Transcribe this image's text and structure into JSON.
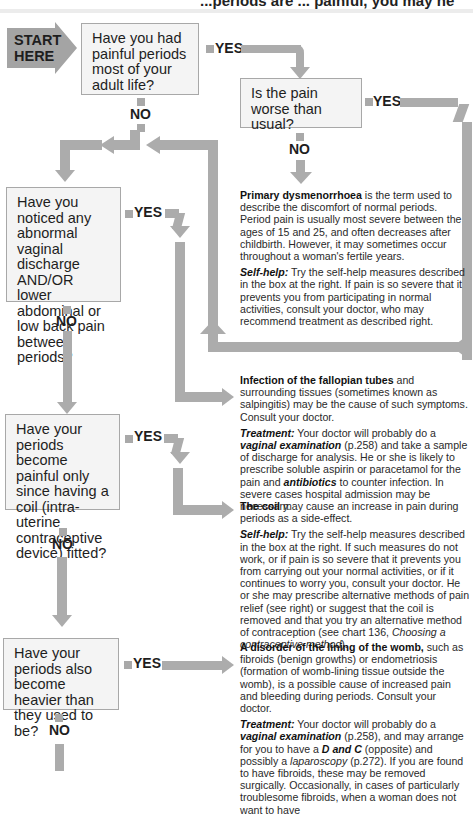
{
  "header": {
    "partial_text": "...periods are ... painful, you may ne"
  },
  "start": {
    "line1": "START",
    "line2": "HERE"
  },
  "labels": {
    "yes": "YES",
    "no": "NO"
  },
  "questions": [
    {
      "id": "q1",
      "text": "Have you had painful periods most of your adult life?"
    },
    {
      "id": "q2",
      "text": "Is the pain worse than usual?"
    },
    {
      "id": "q3",
      "text": "Have you noticed any abnormal vaginal discharge AND/OR lower abdominal or low back pain between periods?"
    },
    {
      "id": "q4",
      "text": "Have your periods become painful only since having a coil (intra-uterine contraceptive device) fitted?"
    },
    {
      "id": "q5",
      "text": "Have your periods also become heavier than they used to be?"
    }
  ],
  "outcomes": {
    "dysmenorrhoea": {
      "title": "Primary dysmenorrhoea",
      "body": " is the term used to describe the discomfort of normal periods. Period pain is usually most severe between the ages of 15 and 25, and often decreases after childbirth. However, it may sometimes occur throughout a woman's fertile years.",
      "selfhelp_label": "Self-help:",
      "selfhelp": " Try the self-help measures described in the box at the right. If pain is so severe that it prevents you from participating in normal activities, consult your doctor, who may recommend treatment as described right."
    },
    "infection": {
      "title": "Infection of the fallopian tubes",
      "body": " and surrounding tissues (sometimes known as salpingitis) may be the cause of such symptoms. Consult your doctor.",
      "treatment_label": "Treatment:",
      "t1": " Your doctor will probably do a ",
      "t_em1": "vaginal examination",
      "t2": " (p.258) and take a sample of discharge for analysis. He or she is likely to prescribe soluble aspirin or paracetamol for the pain and ",
      "t_em2": "antibiotics",
      "t3": " to counter infection. In severe cases hospital admission may be necessary."
    },
    "coil": {
      "title": "The coil",
      "body": " may cause an increase in pain during periods as a side-effect.",
      "selfhelp_label": "Self-help:",
      "s1": " Try the self-help measures described in the box at the right. If such measures do not work, or if pain is so severe that it prevents you from carrying out your normal activities, or if it continues to worry you, consult your doctor. He or she may prescribe alternative methods of pain relief (see right) or suggest that the coil is removed and that you try an alternative method of contraception (see chart 136, ",
      "s_em": "Choosing a contraceptive method",
      "s2": ")."
    },
    "womb": {
      "title": "A disorder of the lining of the womb,",
      "body": " such as fibroids (benign growths) or endometriosis (formation of womb-lining tissue outside the womb), is a possible cause of increased pain and bleeding during periods. Consult your doctor.",
      "treatment_label": "Treatment:",
      "t1": " Your doctor will probably do a ",
      "t_em1": "vaginal examination",
      "t2": " (p.258), and may arrange for you to have a ",
      "t_em2": "D and C",
      "t3": " (opposite) and possibly a ",
      "t_em3": "laparoscopy",
      "t4": " (p.272). If you are found to have fibroids, these may be removed surgically. Occasionally, in cases of particularly troublesome fibroids, when a woman does not want to have"
    }
  },
  "colors": {
    "arrow": "#acacac",
    "box_bg": "#f4f4f4",
    "box_border": "#a8a8a8"
  }
}
